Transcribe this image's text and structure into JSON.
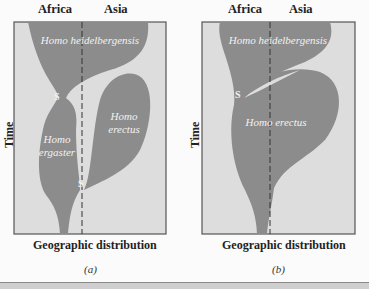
{
  "colors": {
    "panel_bg": "#dddddd",
    "species_fill": "#8c8c8c",
    "border": "#555555",
    "text_light": "#f2f2f2"
  },
  "panels": [
    {
      "id": "a",
      "caption": "(a)",
      "region_labels": [
        "Africa",
        "Asia"
      ],
      "y_axis_label": "Time",
      "x_axis_label": "Geographic distribution",
      "species": [
        {
          "name": "Homo heidelbergensis"
        },
        {
          "name_line1": "Homo",
          "name_line2": "ergaster"
        },
        {
          "name_line1": "Homo",
          "name_line2": "erectus"
        }
      ],
      "speciation_markers": [
        "S",
        "S"
      ]
    },
    {
      "id": "b",
      "caption": "(b)",
      "region_labels": [
        "Africa",
        "Asia"
      ],
      "y_axis_label": "Time",
      "x_axis_label": "Geographic distribution",
      "species": [
        {
          "name": "Homo heidelbergensis"
        },
        {
          "name": "Homo erectus"
        }
      ],
      "speciation_markers": [
        "S"
      ]
    }
  ]
}
